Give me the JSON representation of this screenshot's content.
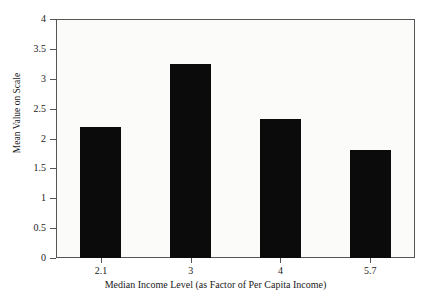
{
  "chart_data": {
    "type": "bar",
    "title": "",
    "title_note": "title row is clipped off the top edge of the screenshot and is not legible",
    "categories": [
      "2.1",
      "3",
      "4",
      "5.7"
    ],
    "values": [
      2.19,
      3.25,
      2.33,
      1.81
    ],
    "xlabel": "Median Income Level (as Factor of Per Capita Income)",
    "ylabel": "Mean Value on Scale",
    "ylim": [
      0,
      4
    ],
    "ytick_labels": [
      "0",
      "0.5",
      "1",
      "1.5",
      "2",
      "2.5",
      "3",
      "3.5",
      "4"
    ],
    "ytick_values": [
      0,
      0.5,
      1,
      1.5,
      2,
      2.5,
      3,
      3.5,
      4
    ],
    "grid": false,
    "legend": "none",
    "bar_color": "#0b0b0b",
    "plot_background": "#fbfbfa",
    "axis_color": "#555555"
  }
}
